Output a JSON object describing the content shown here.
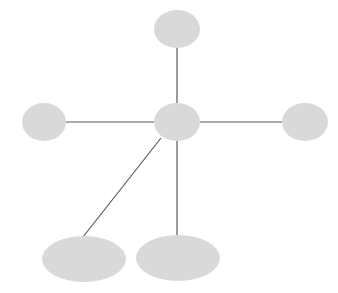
{
  "diagram": {
    "type": "star-network",
    "background": "#ffffff",
    "node_fill": "#d9d9d9",
    "edge_color": "#5a5a5a",
    "nodes": [
      {
        "id": "center",
        "label": "",
        "cx": 177,
        "cy": 122,
        "rx": 23,
        "ry": 19
      },
      {
        "id": "top",
        "label": "",
        "cx": 177,
        "cy": 29,
        "rx": 23,
        "ry": 19
      },
      {
        "id": "left",
        "label": "",
        "cx": 44,
        "cy": 122,
        "rx": 22,
        "ry": 19
      },
      {
        "id": "right",
        "label": "",
        "cx": 305,
        "cy": 122,
        "rx": 23,
        "ry": 19
      },
      {
        "id": "bottom-left",
        "label": "",
        "cx": 84,
        "cy": 259,
        "rx": 42,
        "ry": 23
      },
      {
        "id": "bottom-right",
        "label": "",
        "cx": 178,
        "cy": 258,
        "rx": 42,
        "ry": 23
      }
    ],
    "edges": [
      {
        "from": "center",
        "to": "top",
        "x1": 177,
        "y1": 103,
        "x2": 177,
        "y2": 48
      },
      {
        "from": "center",
        "to": "left",
        "x1": 154,
        "y1": 122,
        "x2": 66,
        "y2": 122
      },
      {
        "from": "center",
        "to": "right",
        "x1": 200,
        "y1": 122,
        "x2": 282,
        "y2": 122
      },
      {
        "from": "center",
        "to": "bottom-left",
        "x1": 161,
        "y1": 138,
        "x2": 83,
        "y2": 237
      },
      {
        "from": "center",
        "to": "bottom-right",
        "x1": 177,
        "y1": 141,
        "x2": 177,
        "y2": 235
      }
    ]
  }
}
